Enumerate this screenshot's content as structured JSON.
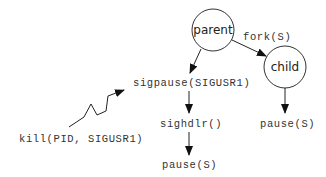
{
  "diagram": {
    "nodes": {
      "parent": {
        "label": "parent",
        "shape": "circle"
      },
      "child": {
        "label": "child",
        "shape": "circle"
      }
    },
    "labels": {
      "fork": "fork(S)",
      "sigpause": "sigpause(SIGUSR1)",
      "sighdlr": "sighdlr()",
      "pause_left": "pause(S)",
      "pause_right": "pause(S)",
      "kill": "kill(PID, SIGUSR1)"
    },
    "edges": [
      {
        "from": "parent",
        "to": "child",
        "label": "fork(S)"
      },
      {
        "from": "parent",
        "to": "sigpause(SIGUSR1)"
      },
      {
        "from": "sigpause(SIGUSR1)",
        "to": "sighdlr()"
      },
      {
        "from": "sighdlr()",
        "to": "pause(S)"
      },
      {
        "from": "child",
        "to": "pause(S)"
      },
      {
        "from": "kill(PID, SIGUSR1)",
        "to": "sigpause(SIGUSR1)",
        "style": "lightning"
      }
    ],
    "colors": {
      "stroke": "#222222",
      "text": "#333333"
    }
  }
}
